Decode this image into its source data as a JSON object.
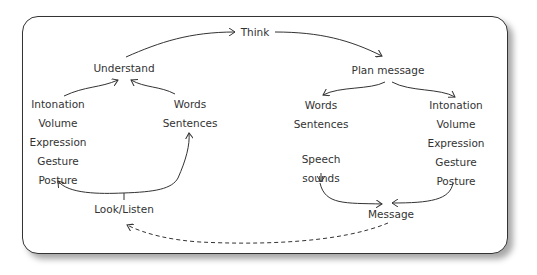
{
  "diagram": {
    "type": "communication-cycle",
    "nodes": {
      "think": "Think",
      "understand": "Understand",
      "plan_message": "Plan message",
      "look_listen": "Look/Listen",
      "message": "Message"
    },
    "receiver_nonverbal": [
      "Intonation",
      "Volume",
      "Expression",
      "Gesture",
      "Posture"
    ],
    "receiver_verbal": [
      "Words",
      "Sentences"
    ],
    "sender_verbal": [
      "Words",
      "Sentences"
    ],
    "sender_speech": [
      "Speech",
      "sounds"
    ],
    "sender_nonverbal": [
      "Intonation",
      "Volume",
      "Expression",
      "Gesture",
      "Posture"
    ],
    "edges": [
      {
        "from": "Understand",
        "to": "Think",
        "style": "solid"
      },
      {
        "from": "Think",
        "to": "Plan message",
        "style": "solid"
      },
      {
        "from": "Plan message",
        "to": "Words/Sentences",
        "style": "solid"
      },
      {
        "from": "Plan message",
        "to": "Intonation/Volume/Expression/Gesture/Posture",
        "style": "solid"
      },
      {
        "from": "Sentences",
        "to": "Speech sounds",
        "style": "solid"
      },
      {
        "from": "Speech sounds",
        "to": "Message",
        "style": "solid"
      },
      {
        "from": "Posture (sender)",
        "to": "Message",
        "style": "solid"
      },
      {
        "from": "Message",
        "to": "Look/Listen",
        "style": "dashed"
      },
      {
        "from": "Look/Listen",
        "to": "Posture (receiver)",
        "style": "solid"
      },
      {
        "from": "Look/Listen",
        "to": "Sentences (receiver)",
        "style": "solid"
      },
      {
        "from": "Intonation (receiver)",
        "to": "Understand",
        "style": "solid"
      },
      {
        "from": "Words (receiver)",
        "to": "Understand",
        "style": "solid"
      }
    ]
  }
}
